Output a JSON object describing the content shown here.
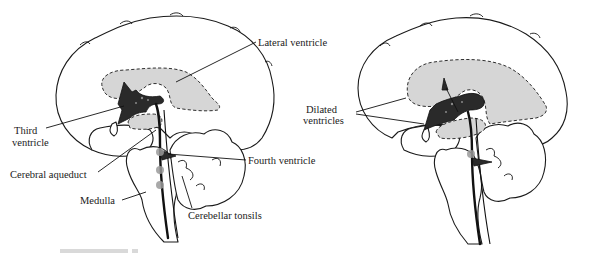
{
  "figure": {
    "panels": [
      {
        "id": "normal",
        "labels": {
          "lateral_ventricle": "Lateral ventricle",
          "third_ventricle_line1": "Third",
          "third_ventricle_line2": "ventricle",
          "cerebral_aqueduct": "Cerebral aqueduct",
          "fourth_ventricle": "Fourth ventricle",
          "medulla": "Medulla",
          "cerebellar_tonsils": "Cerebellar tonsils"
        }
      },
      {
        "id": "hydrocephalus",
        "labels": {
          "dilated_ventricles_line1": "Dilated",
          "dilated_ventricles_line2": "ventricles"
        }
      }
    ],
    "colors": {
      "ventricle_fill": "#d6d6d6",
      "line": "#1a1a1a",
      "obstruction_dot": "#9a9a9a"
    }
  }
}
